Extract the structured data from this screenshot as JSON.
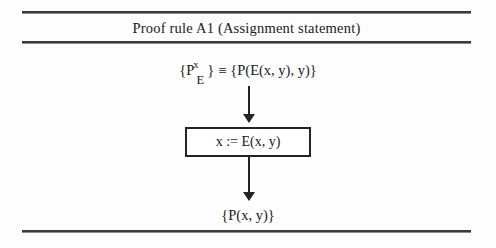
{
  "figure": {
    "title": "Proof rule A1 (Assignment statement)",
    "precondition": {
      "base_open": "{P",
      "superscript": "x",
      "subscript": "E",
      "base_close": "}",
      "equivalence_symbol": "≡",
      "expansion": "{P(E(x, y), y)}",
      "full_text": "{P^x_E} ≡ {P(E(x, y), y)}"
    },
    "statement": {
      "text": "x := E(x, y)"
    },
    "postcondition": {
      "text": "{P(x, y)}"
    },
    "arrows": {
      "upper_label": "",
      "lower_label": ""
    },
    "colors": {
      "rule_line": "#3a3a3a",
      "box_border": "#232323",
      "arrow": "#232323",
      "text": "#1a1a1a",
      "background": "#fdfdfd"
    }
  }
}
